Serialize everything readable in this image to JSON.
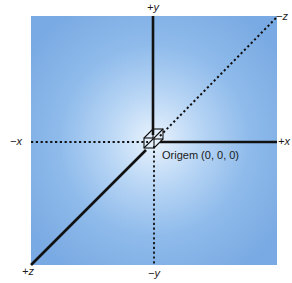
{
  "diagram": {
    "type": "3d-coordinate-axes",
    "background_color_center": "#e9f3fd",
    "background_color_edge": "#7aaae3",
    "axis_color": "#111111",
    "axes": [
      {
        "id": "pos-y",
        "label": "+y",
        "style": "solid"
      },
      {
        "id": "neg-y",
        "label": "−y",
        "style": "dotted"
      },
      {
        "id": "pos-x",
        "label": "+x",
        "style": "solid"
      },
      {
        "id": "neg-x",
        "label": "−x",
        "style": "dotted"
      },
      {
        "id": "pos-z",
        "label": "+z",
        "style": "solid"
      },
      {
        "id": "neg-z",
        "label": "−z",
        "style": "dotted"
      }
    ],
    "origin": {
      "label": "Origem (0, 0, 0)",
      "marker": "unit-cube"
    }
  }
}
